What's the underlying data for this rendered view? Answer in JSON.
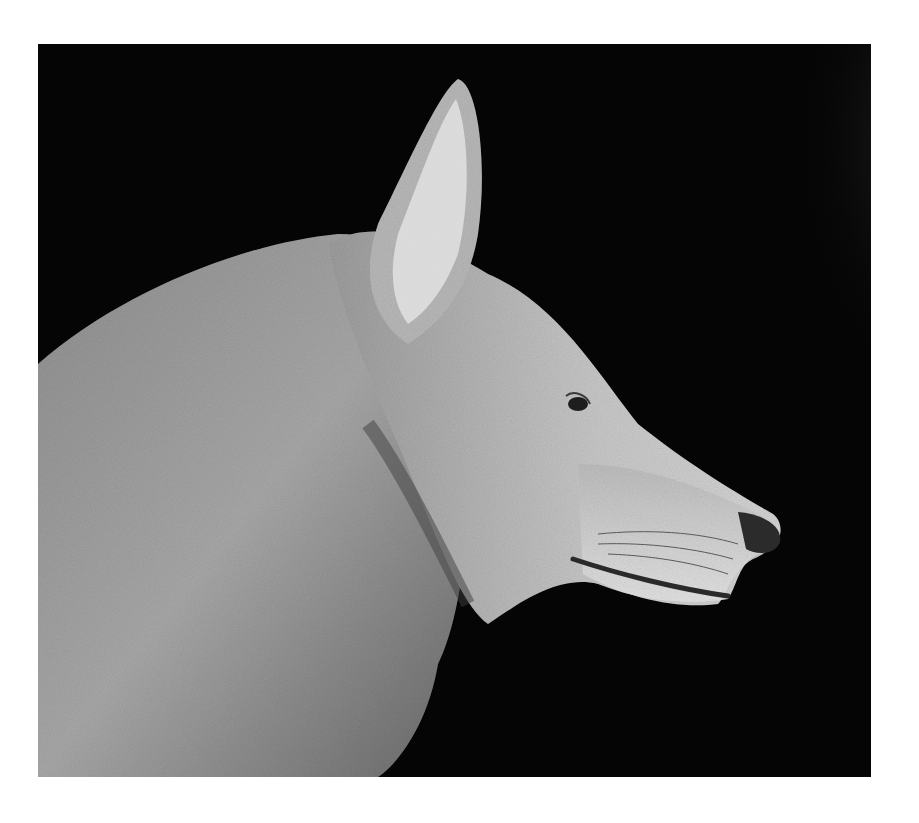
{
  "image": {
    "alt": "Black and white photograph of a wolf's head in profile facing right against a dark background",
    "subject": "wolf",
    "style": "grayscale photograph",
    "colors": {
      "background_border": "#ffffff",
      "photo_background": "#050505",
      "fur_light": "#d8d8d8",
      "fur_mid": "#9a9a9a",
      "fur_dark": "#4a4a4a"
    }
  }
}
